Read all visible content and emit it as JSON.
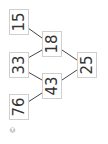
{
  "puzzle": {
    "type": "number-pyramid",
    "orientation": "rotated-90-ccw",
    "cells": {
      "base_1": "15",
      "base_2": "33",
      "base_3": "76",
      "middle_1": "18",
      "middle_2": "43",
      "top": "25"
    }
  },
  "footer": {
    "copyright": "©"
  },
  "colors": {
    "border": "#cfcfcf",
    "text": "#333333",
    "line": "#444444"
  }
}
